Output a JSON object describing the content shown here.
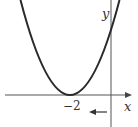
{
  "diagram": {
    "type": "parabola-graph",
    "curve": {
      "description": "upward-opening parabola with vertex on x-axis",
      "vertex_x_label": "-2",
      "color": "#2a2a2a"
    },
    "axes": {
      "x_label": "x",
      "y_label": "y",
      "color": "#555555"
    },
    "tick_labels": [
      "−2"
    ],
    "annotation": {
      "type": "arrow",
      "direction": "left",
      "description": "shift left arrow"
    }
  }
}
